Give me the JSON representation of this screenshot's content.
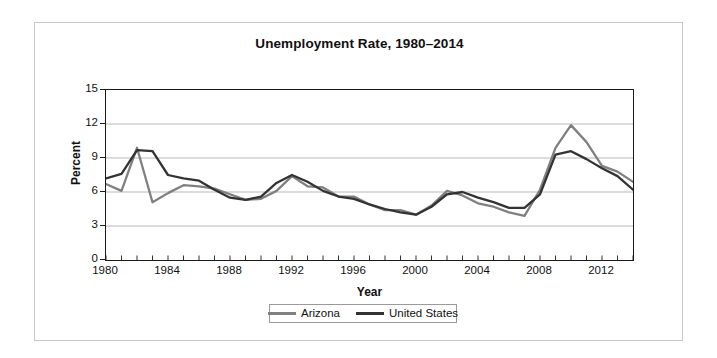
{
  "chart_data": {
    "type": "line",
    "title": "Unemployment Rate, 1980–2014",
    "xlabel": "Year",
    "ylabel": "Percent",
    "xlim": [
      1980,
      2014
    ],
    "ylim": [
      0,
      15
    ],
    "yticks": [
      0,
      3,
      6,
      9,
      12,
      15
    ],
    "xticks": [
      1980,
      1984,
      1988,
      1992,
      1996,
      2000,
      2004,
      2008,
      2012
    ],
    "xtick_labels": [
      "1980",
      "1984",
      "1988",
      "1992",
      "1996",
      "2000",
      "2004",
      "2008",
      "2012"
    ],
    "ytick_labels": [
      "0",
      "3",
      "6",
      "9",
      "12",
      "15"
    ],
    "x_minor_tick_step": 1,
    "grid": "horizontal",
    "grid_color": "#b0b0b0",
    "legend_position": "below-center",
    "x": [
      1980,
      1981,
      1982,
      1983,
      1984,
      1985,
      1986,
      1987,
      1988,
      1989,
      1990,
      1991,
      1992,
      1993,
      1994,
      1995,
      1996,
      1997,
      1998,
      1999,
      2000,
      2001,
      2002,
      2003,
      2004,
      2005,
      2006,
      2007,
      2008,
      2009,
      2010,
      2011,
      2012,
      2013,
      2014
    ],
    "series": [
      {
        "name": "Arizona",
        "color": "#808080",
        "values": [
          6.7,
          6.1,
          9.9,
          5.1,
          5.9,
          6.6,
          6.5,
          6.3,
          5.8,
          5.3,
          5.4,
          6.1,
          7.4,
          6.5,
          6.4,
          5.6,
          5.6,
          4.9,
          4.4,
          4.4,
          4.0,
          4.8,
          6.1,
          5.7,
          5.0,
          4.7,
          4.2,
          3.9,
          6.2,
          9.9,
          11.9,
          10.4,
          8.3,
          7.8,
          6.9
        ]
      },
      {
        "name": "United States",
        "color": "#333333",
        "values": [
          7.2,
          7.6,
          9.7,
          9.6,
          7.5,
          7.2,
          7.0,
          6.2,
          5.5,
          5.3,
          5.6,
          6.8,
          7.5,
          6.9,
          6.1,
          5.6,
          5.4,
          4.9,
          4.5,
          4.2,
          4.0,
          4.7,
          5.8,
          6.0,
          5.5,
          5.1,
          4.6,
          4.6,
          5.8,
          9.3,
          9.6,
          8.9,
          8.1,
          7.4,
          6.2
        ]
      }
    ]
  },
  "legend": {
    "entries": [
      {
        "label": "Arizona"
      },
      {
        "label": "United States"
      }
    ]
  }
}
